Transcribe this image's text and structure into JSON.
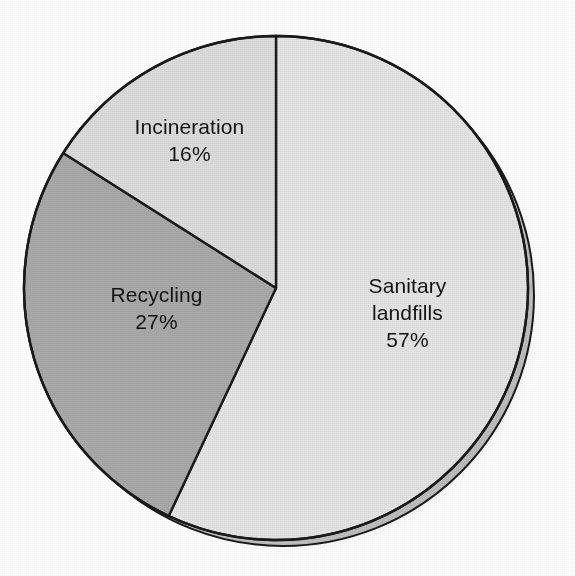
{
  "chart_data": {
    "type": "pie",
    "title": "",
    "subtitle": "",
    "xlabel": "",
    "ylabel": "",
    "legend_position": "none",
    "grid": false,
    "labels_on_slices": true,
    "unit": "%",
    "total": 100,
    "start_angle_deg": 0,
    "direction": "clockwise",
    "categories": [
      "Sanitary landfills",
      "Recycling",
      "Incineration"
    ],
    "values": [
      57,
      27,
      16
    ],
    "slices": [
      {
        "name": "Sanitary landfills",
        "label_line1": "Sanitary",
        "label_line2": "landfills",
        "value": 57,
        "value_text": "57%",
        "color": "#e4e4e4",
        "start_angle_deg": 0,
        "end_angle_deg": 205.2
      },
      {
        "name": "Recycling",
        "label_line1": "Recycling",
        "label_line2": "",
        "value": 27,
        "value_text": "27%",
        "color": "#a9a9a9",
        "start_angle_deg": 205.2,
        "end_angle_deg": 302.4
      },
      {
        "name": "Incineration",
        "label_line1": "Incineration",
        "label_line2": "",
        "value": 16,
        "value_text": "16%",
        "color": "#dcdcdc",
        "start_angle_deg": 302.4,
        "end_angle_deg": 360
      }
    ]
  },
  "figure": {
    "background_color": "#ffffff",
    "outline_color": "#1a1a1a",
    "shadow_rim_color": "#c9c9c9",
    "text_color": "#131313"
  }
}
